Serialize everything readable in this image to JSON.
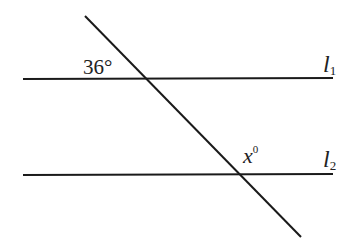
{
  "figure": {
    "lines": {
      "l1": {
        "name": "l",
        "subscript": "1"
      },
      "l2": {
        "name": "l",
        "subscript": "2"
      }
    },
    "angles": {
      "known": {
        "value": "36",
        "unit": "°",
        "text": "36°"
      },
      "unknown": {
        "var": "x",
        "unit": "0"
      }
    },
    "colors": {
      "stroke": "#1a1a1a",
      "background": "#ffffff"
    }
  }
}
